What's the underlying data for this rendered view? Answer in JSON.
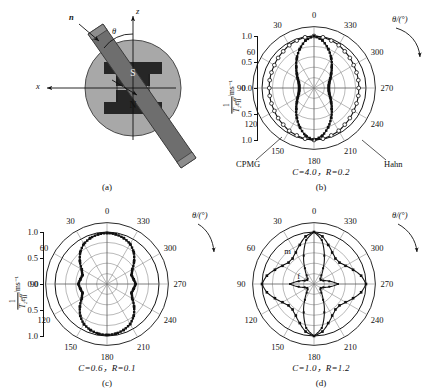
{
  "figure": {
    "background": "#ffffff",
    "ink": "#111111",
    "grid_color": "#8a8a8a"
  },
  "panels": [
    {
      "id": "a",
      "type": "schematic",
      "caption_letter": "(a)",
      "labels": {
        "normal_vector": "n",
        "angle": "θ",
        "z_axis": "z",
        "x_axis": "x",
        "pole_top": "S",
        "pole_bottom": "N"
      },
      "colors": {
        "disk": "#a8a8a8",
        "magnet": "#262626",
        "bar": "#6e6e6e",
        "bar_edge": "#3a3a3a"
      }
    },
    {
      "id": "b",
      "type": "polar",
      "caption_letter": "(b)",
      "caption_params": "C=4.0，R=0.2",
      "series_labels": {
        "left": "CPMG",
        "right": "Hahn"
      },
      "curve_annotations": []
    },
    {
      "id": "c",
      "type": "polar",
      "caption_letter": "(c)",
      "caption_params": "C=0.6，R=0.1",
      "series_labels": {},
      "curve_annotations": []
    },
    {
      "id": "d",
      "type": "polar",
      "caption_letter": "(d)",
      "caption_params": "C=1.0，R=1.2",
      "series_labels": {},
      "curve_annotations": [
        {
          "text": "m",
          "r": 0.8,
          "theta": 40
        },
        {
          "text": "f",
          "r": 0.3,
          "theta": 62
        }
      ]
    }
  ],
  "axes": {
    "theta_axis_label": "θ/(°)",
    "radial_axis_label_numerator": "1",
    "radial_axis_label_denominator": "T₂eff",
    "radial_axis_units": "/ms⁻¹",
    "radial_tick_labels": [
      "1.0",
      "0.5",
      "0.0",
      "0.5",
      "1.0"
    ],
    "radial_ticks": [
      0.2,
      0.4,
      0.6,
      0.8,
      1.0
    ],
    "theta_tick_labels": [
      "0",
      "30",
      "60",
      "90",
      "120",
      "150",
      "180",
      "210",
      "240",
      "270",
      "300",
      "330"
    ],
    "theta_tick_step_deg": 30,
    "rlim": [
      0,
      1.0
    ],
    "grid": true,
    "direction": "clockwise-from-top"
  },
  "chart_data": [
    {
      "id": "b",
      "type": "line",
      "plot_kind": "polar",
      "title": "C=4.0, R=0.2",
      "xlabel": "θ/(°)",
      "ylabel": "1/T2eff /ms^-1",
      "ylim": [
        0,
        1.0
      ],
      "grid": true,
      "theta_deg": [
        0,
        10,
        20,
        30,
        40,
        50,
        60,
        70,
        80,
        90,
        100,
        110,
        120,
        130,
        140,
        150,
        160,
        170,
        180,
        190,
        200,
        210,
        220,
        230,
        240,
        250,
        260,
        270,
        280,
        290,
        300,
        310,
        320,
        330,
        340,
        350
      ],
      "series": [
        {
          "name": "CPMG",
          "marker": "filled-square",
          "color": "#111111",
          "values": [
            1.0,
            0.93,
            0.8,
            0.66,
            0.53,
            0.43,
            0.36,
            0.31,
            0.29,
            0.285,
            0.29,
            0.31,
            0.36,
            0.43,
            0.53,
            0.66,
            0.8,
            0.93,
            1.0,
            0.93,
            0.8,
            0.66,
            0.53,
            0.43,
            0.36,
            0.31,
            0.29,
            0.285,
            0.29,
            0.31,
            0.36,
            0.43,
            0.53,
            0.66,
            0.8,
            0.93
          ]
        },
        {
          "name": "Hahn",
          "marker": "open-circle",
          "color": "#111111",
          "values": [
            1.0,
            0.99,
            0.97,
            0.95,
            0.92,
            0.9,
            0.88,
            0.87,
            0.865,
            0.86,
            0.865,
            0.87,
            0.88,
            0.9,
            0.92,
            0.95,
            0.97,
            0.99,
            1.0,
            0.99,
            0.97,
            0.95,
            0.92,
            0.9,
            0.88,
            0.87,
            0.865,
            0.86,
            0.865,
            0.87,
            0.88,
            0.9,
            0.92,
            0.95,
            0.97,
            0.99
          ]
        }
      ]
    },
    {
      "id": "c",
      "type": "line",
      "plot_kind": "polar",
      "title": "C=0.6, R=0.1",
      "xlabel": "θ/(°)",
      "ylabel": "1/T2eff /ms^-1",
      "ylim": [
        0,
        1.0
      ],
      "grid": true,
      "theta_deg": [
        0,
        10,
        20,
        30,
        40,
        50,
        60,
        70,
        80,
        90,
        100,
        110,
        120,
        130,
        140,
        150,
        160,
        170,
        180,
        190,
        200,
        210,
        220,
        230,
        240,
        250,
        260,
        270,
        280,
        290,
        300,
        310,
        320,
        330,
        340,
        350
      ],
      "series": [
        {
          "name": "1/T2eff",
          "marker": "filled-square",
          "color": "#111111",
          "values": [
            0.98,
            0.97,
            0.94,
            0.89,
            0.8,
            0.68,
            0.56,
            0.5,
            0.52,
            0.55,
            0.52,
            0.5,
            0.56,
            0.68,
            0.8,
            0.89,
            0.94,
            0.97,
            0.98,
            0.97,
            0.94,
            0.89,
            0.8,
            0.68,
            0.56,
            0.5,
            0.52,
            0.55,
            0.52,
            0.5,
            0.56,
            0.68,
            0.8,
            0.89,
            0.94,
            0.97
          ]
        }
      ]
    },
    {
      "id": "d",
      "type": "line",
      "plot_kind": "polar",
      "title": "C=1.0, R=1.2",
      "xlabel": "θ/(°)",
      "ylabel": "1/T2eff /ms^-1",
      "ylim": [
        0,
        1.0
      ],
      "grid": true,
      "theta_deg": [
        0,
        10,
        20,
        30,
        40,
        50,
        60,
        70,
        80,
        90,
        100,
        110,
        120,
        130,
        140,
        150,
        160,
        170,
        180,
        190,
        200,
        210,
        220,
        230,
        240,
        250,
        260,
        270,
        280,
        290,
        300,
        310,
        320,
        330,
        340,
        350
      ],
      "series": [
        {
          "name": "m",
          "marker": "filled-square",
          "color": "#111111",
          "values": [
            1.0,
            0.93,
            0.8,
            0.7,
            0.64,
            0.64,
            0.7,
            0.8,
            0.92,
            1.0,
            0.92,
            0.8,
            0.7,
            0.64,
            0.64,
            0.7,
            0.8,
            0.93,
            1.0,
            0.93,
            0.8,
            0.7,
            0.64,
            0.64,
            0.7,
            0.8,
            0.92,
            1.0,
            0.92,
            0.8,
            0.7,
            0.64,
            0.64,
            0.7,
            0.8,
            0.93
          ]
        },
        {
          "name": "f",
          "marker": "filled-square-small",
          "color": "#111111",
          "values": [
            1.0,
            0.86,
            0.58,
            0.35,
            0.22,
            0.16,
            0.15,
            0.19,
            0.3,
            0.46,
            0.3,
            0.19,
            0.15,
            0.16,
            0.22,
            0.35,
            0.58,
            0.86,
            1.0,
            0.86,
            0.58,
            0.35,
            0.22,
            0.16,
            0.15,
            0.19,
            0.3,
            0.46,
            0.3,
            0.19,
            0.15,
            0.16,
            0.22,
            0.35,
            0.58,
            0.86
          ]
        }
      ]
    }
  ]
}
